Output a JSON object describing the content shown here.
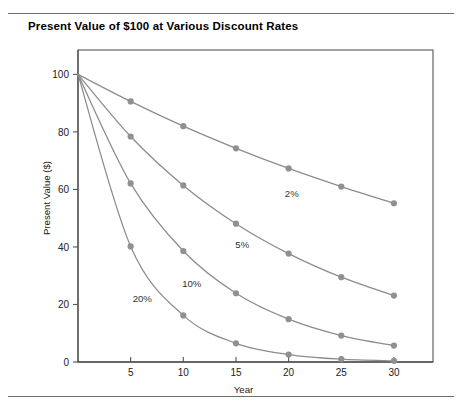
{
  "figure": {
    "title": "Present Value of $100 at Various Discount Rates"
  },
  "chart_data": {
    "type": "line",
    "title": "Present Value of $100 at Various Discount Rates",
    "xlabel": "Year",
    "ylabel": "Present Value ($)",
    "xlim": [
      0,
      32
    ],
    "ylim": [
      0,
      105
    ],
    "xticks": [
      5,
      10,
      15,
      20,
      25,
      30
    ],
    "yticks": [
      0,
      20,
      40,
      60,
      80,
      100
    ],
    "xtick_labels": [
      "5",
      "10",
      "15",
      "20",
      "25",
      "30"
    ],
    "ytick_labels": [
      "0",
      "20",
      "40",
      "60",
      "80",
      "100"
    ],
    "grid": false,
    "legend": "inline-labels",
    "marker": "circle",
    "line_color": "#8c8c8c",
    "marker_color": "#909090",
    "x": [
      0,
      5,
      10,
      15,
      20,
      25,
      30
    ],
    "series": [
      {
        "name": "2%",
        "label": "2%",
        "label_x": 20.3,
        "label_y": 57.5,
        "values": [
          100,
          90.6,
          82.0,
          74.3,
          67.3,
          61.0,
          55.2
        ]
      },
      {
        "name": "5%",
        "label": "5%",
        "label_x": 15.6,
        "label_y": 39.5,
        "values": [
          100,
          78.4,
          61.4,
          48.1,
          37.7,
          29.5,
          23.1
        ]
      },
      {
        "name": "10%",
        "label": "10%",
        "label_x": 10.8,
        "label_y": 26.0,
        "values": [
          100,
          62.1,
          38.6,
          23.9,
          14.9,
          9.2,
          5.7
        ]
      },
      {
        "name": "20%",
        "label": "20%",
        "label_x": 6.1,
        "label_y": 21.0,
        "values": [
          100,
          40.2,
          16.2,
          6.5,
          2.6,
          1.0,
          0.4
        ]
      }
    ]
  }
}
